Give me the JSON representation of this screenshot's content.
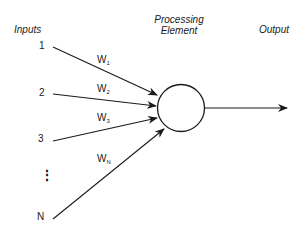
{
  "diagram": {
    "title_inputs": "Inputs",
    "title_processing_line1": "Processing",
    "title_processing_line2": "Element",
    "title_output": "Output",
    "inputs": [
      {
        "label": "1",
        "weight": "W",
        "weight_sub": "1"
      },
      {
        "label": "2",
        "weight": "W",
        "weight_sub": "2"
      },
      {
        "label": "3",
        "weight": "W",
        "weight_sub": "3"
      },
      {
        "label": "N",
        "weight": "W",
        "weight_sub": "N"
      }
    ],
    "ellipsis": "⋮",
    "colors": {
      "stroke": "#1a1a1a",
      "background": "#ffffff"
    }
  }
}
